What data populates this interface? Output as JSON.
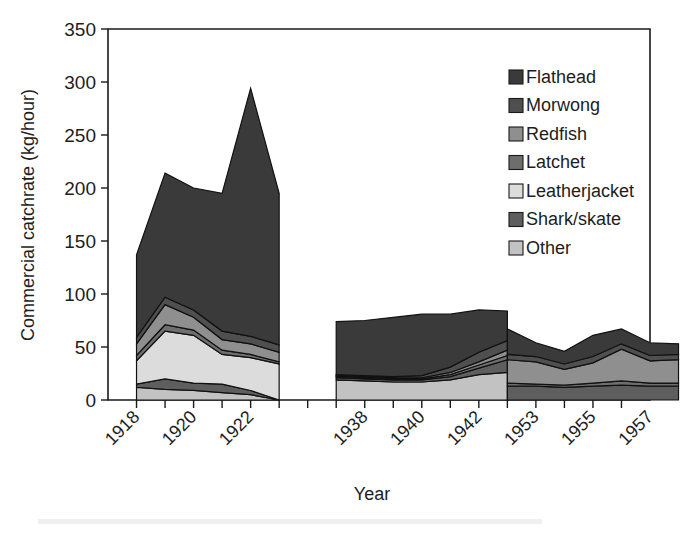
{
  "chart_data": {
    "type": "area",
    "stacked": true,
    "title": "",
    "xlabel": "Year",
    "ylabel": "Commercial catchrate (kg/hour)",
    "ylim": [
      0,
      350
    ],
    "yticks": [
      0,
      50,
      100,
      150,
      200,
      250,
      300,
      350
    ],
    "grid": false,
    "legend_position": "upper-right",
    "axis_break": true,
    "note": "Three disjoint time blocks separated by axis breaks; stacking order bottom-to-top is Other, Shark/skate, Leatherjacket, Latchet, Redfish, Morwong, Flathead",
    "stack_order_bottom_to_top": [
      "Other",
      "Shark/skate",
      "Leatherjacket",
      "Latchet",
      "Redfish",
      "Morwong",
      "Flathead"
    ],
    "series": [
      {
        "name": "Flathead",
        "color": "#3a3a3a",
        "legend_index": 0,
        "values": {
          "block1": [
            78,
            117,
            115,
            130,
            234,
            143
          ],
          "block2": [
            50,
            52,
            56,
            58,
            50,
            40,
            28
          ],
          "block3": [
            24,
            13,
            12,
            20,
            14,
            12,
            10
          ]
        }
      },
      {
        "name": "Morwong",
        "color": "#4f4f4f",
        "legend_index": 1,
        "values": {
          "block1": [
            6,
            7,
            7,
            8,
            7,
            7
          ],
          "block2": [
            1,
            1,
            1,
            2,
            5,
            9,
            9
          ],
          "block3": [
            5,
            5,
            5,
            6,
            5,
            5,
            5
          ]
        }
      },
      {
        "name": "Redfish",
        "color": "#8f8f8f",
        "legend_index": 2,
        "values": {
          "block1": [
            11,
            19,
            12,
            10,
            10,
            9
          ],
          "block2": [
            1,
            1,
            1,
            1,
            2,
            3,
            5
          ],
          "block3": [
            22,
            21,
            15,
            19,
            30,
            21,
            22
          ]
        }
      },
      {
        "name": "Latchet",
        "color": "#6e6e6e",
        "legend_index": 3,
        "values": {
          "block1": [
            5,
            6,
            5,
            4,
            3,
            2
          ],
          "block2": [
            1,
            1,
            1,
            1,
            2,
            3,
            4
          ],
          "block3": [
            3,
            2,
            2,
            3,
            4,
            3,
            3
          ]
        }
      },
      {
        "name": "Leatherjacket",
        "color": "#dcdcdc",
        "legend_index": 4,
        "values": {
          "block1": [
            22,
            45,
            45,
            28,
            31,
            34
          ]
        }
      },
      {
        "name": "Shark/skate",
        "color": "#5e5e5e",
        "legend_index": 5,
        "values": {
          "block1": [
            3,
            10,
            7,
            8,
            4,
            0
          ],
          "block2": [
            2,
            2,
            2,
            2,
            3,
            6,
            12
          ],
          "block3": [
            13,
            13,
            12,
            13,
            14,
            13,
            13
          ]
        }
      },
      {
        "name": "Other",
        "color": "#c2c2c2",
        "legend_index": 6,
        "values": {
          "block1": [
            12,
            10,
            9,
            7,
            5,
            0
          ],
          "block2": [
            19,
            18,
            17,
            17,
            19,
            24,
            26
          ]
        }
      }
    ],
    "blocks": [
      {
        "id": "block1",
        "years": [
          1918,
          1919,
          1920,
          1921,
          1922,
          1923
        ],
        "labeled_ticks": [
          1918,
          1920,
          1922
        ],
        "totals": [
          137,
          214,
          184,
          190,
          294,
          199
        ]
      },
      {
        "id": "block2",
        "years": [
          1937,
          1938,
          1939,
          1940,
          1941,
          1942,
          1943
        ],
        "labeled_ticks": [
          1938,
          1940,
          1942
        ],
        "totals": [
          74,
          76,
          78,
          81,
          86,
          107,
          123
        ]
      },
      {
        "id": "block3",
        "years": [
          1952,
          1953,
          1954,
          1955,
          1956,
          1957,
          1958
        ],
        "labeled_ticks": [
          1953,
          1955,
          1957
        ],
        "totals": [
          79,
          62,
          53,
          66,
          70,
          58,
          56
        ]
      }
    ],
    "ytick_labels": [
      "0",
      "50",
      "100",
      "150",
      "200",
      "250",
      "300",
      "350"
    ],
    "xtick_labels": [
      "1918",
      "1920",
      "1922",
      "1938",
      "1940",
      "1942",
      "1953",
      "1955",
      "1957"
    ]
  },
  "legend": {
    "items": [
      {
        "label": "Flathead",
        "color": "#3a3a3a"
      },
      {
        "label": "Morwong",
        "color": "#4f4f4f"
      },
      {
        "label": "Redfish",
        "color": "#8f8f8f"
      },
      {
        "label": "Latchet",
        "color": "#6e6e6e"
      },
      {
        "label": "Leatherjacket",
        "color": "#dcdcdc"
      },
      {
        "label": "Shark/skate",
        "color": "#5e5e5e"
      },
      {
        "label": "Other",
        "color": "#c2c2c2"
      }
    ]
  },
  "axes": {
    "y_title": "Commercial catchrate (kg/hour)",
    "x_title": "Year"
  }
}
